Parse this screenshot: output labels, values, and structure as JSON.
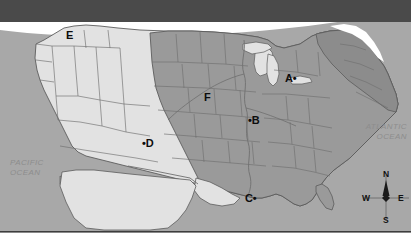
{
  "figure": {
    "kind": "thematic-map",
    "region": "contiguous-united-states",
    "width": 418,
    "height": 245
  },
  "colors": {
    "top_band": "#4a4a4a",
    "ocean": "#a8a8a8",
    "land_light": "#e2e2e2",
    "land_shaded": "#9a9a9a",
    "land_shaded_dark": "#8c8c8c",
    "border_line": "#6f6f6f",
    "outline": "#5c5c5c",
    "baseline_rule": "#3d3d3d",
    "label_text": "#0d0d0d",
    "ocean_text": "#8d8d8d",
    "page_background": "#ffffff"
  },
  "point_labels": [
    {
      "id": "A",
      "text": "A",
      "dot_side": "right",
      "x": 285,
      "y": 73
    },
    {
      "id": "B",
      "text": "B",
      "dot_side": "left",
      "x": 255,
      "y": 115
    },
    {
      "id": "C",
      "text": "C",
      "dot_side": "right",
      "x": 247,
      "y": 193
    },
    {
      "id": "D",
      "text": "D",
      "dot_side": "left",
      "x": 149,
      "y": 138
    },
    {
      "id": "E",
      "text": "E",
      "dot_side": "none",
      "x": 66,
      "y": 30
    },
    {
      "id": "F",
      "text": "F",
      "dot_side": "none",
      "x": 204,
      "y": 92
    }
  ],
  "ocean_labels": [
    {
      "id": "pacific",
      "line1": "PACIFIC",
      "line2": "OCEAN",
      "x": 10,
      "y": 158,
      "align": "left"
    },
    {
      "id": "atlantic",
      "line1": "ATLANTIC",
      "line2": "OCEAN",
      "x": 353,
      "y": 122,
      "align": "right"
    }
  ],
  "compass": {
    "north": "N",
    "south": "S",
    "east": "E",
    "west": "W",
    "center_x": 386,
    "center_y": 198
  }
}
